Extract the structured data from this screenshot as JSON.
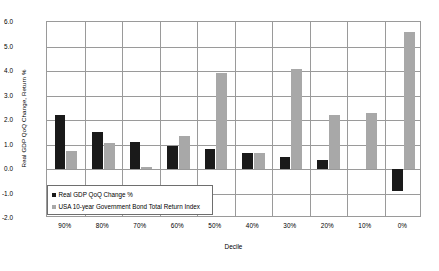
{
  "chart_data": {
    "type": "bar",
    "title": "",
    "xlabel": "Decile",
    "ylabel": "Real GDP QoQ Change, Return %",
    "categories": [
      "90%",
      "80%",
      "70%",
      "60%",
      "50%",
      "40%",
      "30%",
      "20%",
      "10%",
      "0%"
    ],
    "series": [
      {
        "name": "Real GDP QoQ Change %",
        "color": "#1a1a1a",
        "values": [
          2.2,
          1.5,
          1.1,
          0.95,
          0.8,
          0.65,
          0.5,
          0.35,
          0.0,
          -0.9
        ]
      },
      {
        "name": "USA 10-year Government Bond Total Return Index",
        "color": "#a8a8a8",
        "values": [
          0.75,
          1.05,
          0.1,
          1.35,
          3.9,
          0.65,
          4.1,
          2.2,
          2.3,
          5.6
        ]
      }
    ],
    "ylim": [
      -2.0,
      6.0
    ],
    "ytick_labels": [
      "6.0",
      "5.0",
      "4.0",
      "3.0",
      "2.0",
      "1.0",
      "0.0",
      "-1.0",
      "-2.0"
    ],
    "ytick_values": [
      6.0,
      5.0,
      4.0,
      3.0,
      2.0,
      1.0,
      0.0,
      -1.0,
      -2.0
    ],
    "grid": true,
    "legend_position": "inside-bottom-left"
  },
  "legend": {
    "items": [
      {
        "label": "Real GDP QoQ Change %",
        "swatch": "black"
      },
      {
        "label": "USA 10-year Government Bond Total Return Index",
        "swatch": "gray"
      }
    ]
  }
}
